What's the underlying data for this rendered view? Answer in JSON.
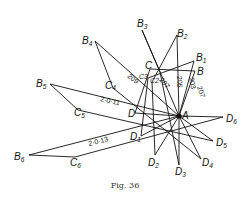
{
  "figure": {
    "caption": "Fig. 36",
    "center_point": {
      "label": "A",
      "x": 179,
      "y": 116
    },
    "points": {
      "B": {
        "label": "B",
        "sub": "",
        "x": 195,
        "y": 71
      },
      "B1": {
        "label": "B",
        "sub": "1",
        "x": 194,
        "y": 61
      },
      "B2": {
        "label": "B",
        "sub": "2",
        "x": 177,
        "y": 35
      },
      "B3": {
        "label": "B",
        "sub": "3",
        "x": 142,
        "y": 30
      },
      "B4": {
        "label": "B",
        "sub": "4",
        "x": 95,
        "y": 41
      },
      "B5": {
        "label": "B",
        "sub": "5",
        "x": 50,
        "y": 84
      },
      "B6": {
        "label": "B",
        "sub": "6",
        "x": 29,
        "y": 155
      },
      "C": {
        "label": "C",
        "sub": "",
        "x": 150,
        "y": 69
      },
      "C4": {
        "label": "C",
        "sub": "4",
        "x": 113,
        "y": 88
      },
      "C5": {
        "label": "C",
        "sub": "5",
        "x": 78,
        "y": 110
      },
      "C6": {
        "label": "C",
        "sub": "6",
        "x": 75,
        "y": 157
      },
      "D": {
        "label": "D",
        "sub": "",
        "x": 135,
        "y": 113
      },
      "D1": {
        "label": "D",
        "sub": "1",
        "x": 141,
        "y": 136
      },
      "D2": {
        "label": "D",
        "sub": "2",
        "x": 155,
        "y": 155
      },
      "D3": {
        "label": "D",
        "sub": "3",
        "x": 179,
        "y": 165
      },
      "D4": {
        "label": "D",
        "sub": "4",
        "x": 201,
        "y": 159
      },
      "D5": {
        "label": "D",
        "sub": "5",
        "x": 213,
        "y": 141
      },
      "D6": {
        "label": "D",
        "sub": "6",
        "x": 223,
        "y": 117
      }
    },
    "angle_labels": [
      "203",
      "205",
      "207",
      "207",
      "209",
      "2·0·11",
      "2·0·13"
    ],
    "small_labels": [
      "C3",
      "C2"
    ]
  }
}
